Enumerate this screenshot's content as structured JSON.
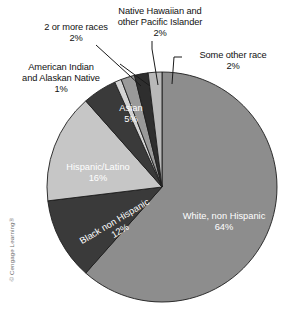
{
  "figure": {
    "credit": "© Cengage Learning®"
  },
  "chart_data": {
    "type": "pie",
    "title": "",
    "total_percent": 100,
    "units": "percent",
    "legend": "none (direct labels)",
    "grid": false,
    "categories": [
      "White, non Hispanic",
      "Black non Hispanic",
      "Hispanic/Latino",
      "Asian",
      "American Indian and Alaskan Native",
      "2 or more races",
      "Native Hawaiian and other Pacific Islander",
      "Some other race"
    ],
    "values": [
      64,
      12,
      16,
      5,
      1,
      2,
      2,
      2
    ],
    "slices": [
      {
        "label": "White, non Hispanic",
        "value": 64,
        "value_text": "64%",
        "color": "#8d8d8d",
        "label_placement": "inside",
        "label_color": "#ffffff"
      },
      {
        "label": "Black non Hispanic",
        "value": 12,
        "value_text": "12%",
        "color": "#3a3a3a",
        "label_placement": "inside-rotated",
        "label_color": "#ffffff"
      },
      {
        "label": "Hispanic/Latino",
        "value": 16,
        "value_text": "16%",
        "color": "#c6c6c6",
        "label_placement": "inside",
        "label_color": "#ffffff"
      },
      {
        "label": "Asian",
        "value": 5,
        "value_text": "5%",
        "color": "#3a3a3a",
        "label_placement": "inside",
        "label_color": "#ffffff"
      },
      {
        "label": "American Indian and Alaskan Native",
        "value": 1,
        "value_text": "1%",
        "color": "#d3d3d3",
        "label_placement": "callout",
        "label_color": "#111111"
      },
      {
        "label": "2 or more races",
        "value": 2,
        "value_text": "2%",
        "color": "#9a9a9a",
        "label_placement": "callout",
        "label_color": "#111111"
      },
      {
        "label": "Native Hawaiian and other Pacific Islander",
        "value": 2,
        "value_text": "2%",
        "color": "#2e2e2e",
        "label_placement": "callout",
        "label_color": "#111111"
      },
      {
        "label": "Some other race",
        "value": 2,
        "value_text": "2%",
        "color": "#b9b9b9",
        "label_placement": "callout",
        "label_color": "#111111"
      }
    ]
  },
  "callouts": {
    "two_or_more_races": {
      "line1": "2 or more races",
      "pct": "2%"
    },
    "native_hawaiian": {
      "line1": "Native Hawaiian and",
      "line2": "other Pacific Islander",
      "pct": "2%"
    },
    "some_other_race": {
      "line1": "Some other race",
      "pct": "2%"
    },
    "american_indian": {
      "line1": "American Indian",
      "line2": "and Alaskan Native",
      "pct": "1%"
    }
  },
  "inside_labels": {
    "white": {
      "name": "White, non Hispanic",
      "pct": "64%"
    },
    "hispanic": {
      "name": "Hispanic/Latino",
      "pct": "16%"
    },
    "asian": {
      "name": "Asian",
      "pct": "5%"
    },
    "black": {
      "name": "Black non Hispanic",
      "pct": "12%"
    }
  }
}
